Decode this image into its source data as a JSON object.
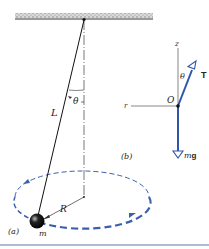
{
  "figure": {
    "panel_a": {
      "label": "(a)",
      "string_label": "L",
      "angle_label": "θ",
      "radius_label": "R",
      "mass_label": "m"
    },
    "panel_b": {
      "label": "(b)",
      "z_axis_label": "z",
      "r_axis_label": "r",
      "origin_label": "O",
      "angle_label": "θ",
      "tension_label": "T",
      "weight_label_m": "m",
      "weight_label_g": "g"
    },
    "colors": {
      "vector_blue": "#2f56a8",
      "orbit_blue": "#3a5fae",
      "ink": "#222222",
      "bottom_rule": "#8fa6cc"
    }
  }
}
